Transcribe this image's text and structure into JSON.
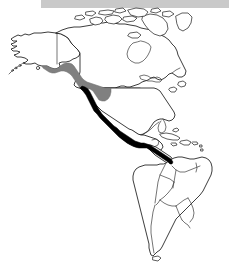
{
  "figure": {
    "kind": "distribution-range-map",
    "region_title": "The Americas",
    "width": 229,
    "height": 266,
    "background_color": "#ffffff"
  },
  "header_bar": {
    "name": "header-bar",
    "color": "#c9c9c9",
    "x": 41,
    "y": 0,
    "width": 188,
    "height": 8
  },
  "map": {
    "outline_color": "#1a1a1a",
    "border_color": "#3a3a3a",
    "fill_color": "#ffffff",
    "landmasses": [
      "alaska",
      "canada-mainland",
      "canadian-arctic-archipelago",
      "greenland-west-edge",
      "united-states",
      "mexico",
      "central-america",
      "caribbean-islands",
      "south-america"
    ],
    "graticule": {
      "us-canada-border-49th-parallel": true,
      "alaska-yukon-border-141st-meridian": true
    }
  },
  "range_overlays": [
    {
      "id": "range-gray",
      "label": "Pacific Northwest coastal range",
      "color": "#808080",
      "pattern": "halftone-gray",
      "extent": "Southern Alaska panhandle through coastal British Columbia into Washington and Oregon"
    },
    {
      "id": "range-black",
      "label": "Pacific coastal range",
      "color": "#000000",
      "pattern": "solid-black",
      "extent": "Northern California down the Pacific coast of Mexico through Central America"
    }
  ],
  "colors": {
    "header_gray": "#c9c9c9",
    "range_gray": "#808080",
    "range_black": "#000000",
    "coastline": "#1a1a1a",
    "land_fill": "#ffffff"
  }
}
